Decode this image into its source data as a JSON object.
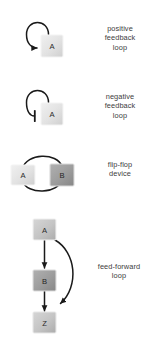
{
  "figure": {
    "background_color": "#ffffff",
    "text_color": "#3c3c3c",
    "edge_color": "#1a1a1a"
  },
  "motifs": [
    {
      "id": "positive-feedback-loop",
      "label": "positive\nfeedback\nloop",
      "nodes": [
        {
          "id": "A",
          "label": "A",
          "fill": "#e3e3e3",
          "shade": "light"
        }
      ],
      "edges": [
        {
          "from": "A",
          "to": "A",
          "type": "activation",
          "head": "arrow",
          "shape": "self-loop"
        }
      ]
    },
    {
      "id": "negative-feedback-loop",
      "label": "negative\nfeedback\nloop",
      "nodes": [
        {
          "id": "A",
          "label": "A",
          "fill": "#e3e3e3",
          "shade": "light"
        }
      ],
      "edges": [
        {
          "from": "A",
          "to": "A",
          "type": "inhibition",
          "head": "t-bar",
          "shape": "self-loop"
        }
      ]
    },
    {
      "id": "flip-flop-device",
      "label": "flip-flop\ndevice",
      "nodes": [
        {
          "id": "A",
          "label": "A",
          "fill": "#e3e3e3",
          "shade": "light"
        },
        {
          "id": "B",
          "label": "B",
          "fill": "#9e9e9e",
          "shade": "dark"
        }
      ],
      "edges": [
        {
          "from": "A",
          "to": "B",
          "type": "inhibition",
          "head": "t-bar",
          "shape": "arc-over"
        },
        {
          "from": "B",
          "to": "A",
          "type": "inhibition",
          "head": "t-bar",
          "shape": "arc-under"
        }
      ]
    },
    {
      "id": "feed-forward-loop",
      "label": "feed-forward\nloop",
      "nodes": [
        {
          "id": "A",
          "label": "A",
          "fill": "#cfcfcf",
          "shade": "light"
        },
        {
          "id": "B",
          "label": "B",
          "fill": "#9e9e9e",
          "shade": "dark"
        },
        {
          "id": "Z",
          "label": "Z",
          "fill": "#bdbdbd",
          "shade": "mid"
        }
      ],
      "edges": [
        {
          "from": "A",
          "to": "B",
          "type": "activation",
          "head": "arrow",
          "shape": "straight-down"
        },
        {
          "from": "B",
          "to": "Z",
          "type": "activation",
          "head": "arrow",
          "shape": "straight-down"
        },
        {
          "from": "A",
          "to": "Z",
          "type": "activation",
          "head": "arrow",
          "shape": "bypass-curve"
        }
      ]
    }
  ]
}
